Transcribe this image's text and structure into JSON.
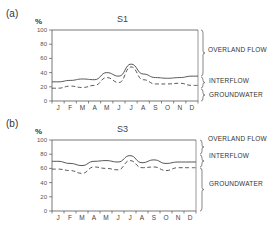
{
  "chart_data": [
    {
      "type": "line",
      "panel_label": "(a)",
      "title": "S1",
      "ylabel": "%",
      "xlabel": "",
      "ylim": [
        0,
        100
      ],
      "yticks": [
        "0",
        "20",
        "40",
        "60",
        "80",
        "100"
      ],
      "categories": [
        "J",
        "F",
        "M",
        "A",
        "M",
        "J",
        "J",
        "A",
        "S",
        "O",
        "N",
        "D"
      ],
      "series": [
        {
          "name": "Overland flow / Interflow boundary",
          "style": "solid",
          "values": [
            27,
            29,
            31,
            30,
            40,
            35,
            52,
            38,
            33,
            32,
            33,
            35
          ]
        },
        {
          "name": "Interflow / Groundwater boundary",
          "style": "dashed",
          "values": [
            18,
            21,
            19,
            22,
            33,
            26,
            48,
            30,
            24,
            24,
            25,
            22
          ]
        }
      ],
      "zones": [
        "OVERLAND FLOW",
        "INTERFLOW",
        "GROUNDWATER"
      ],
      "grid": false
    },
    {
      "type": "line",
      "panel_label": "(b)",
      "title": "S3",
      "ylabel": "%",
      "xlabel": "",
      "ylim": [
        0,
        100
      ],
      "yticks": [
        "0",
        "20",
        "40",
        "60",
        "80",
        "100"
      ],
      "categories": [
        "J",
        "F",
        "M",
        "A",
        "M",
        "J",
        "J",
        "A",
        "S",
        "O",
        "N",
        "D"
      ],
      "series": [
        {
          "name": "Overland flow / Interflow boundary",
          "style": "solid",
          "values": [
            70,
            67,
            64,
            70,
            71,
            69,
            78,
            68,
            72,
            67,
            69,
            69
          ]
        },
        {
          "name": "Interflow / Groundwater boundary",
          "style": "dashed",
          "values": [
            59,
            57,
            53,
            62,
            60,
            58,
            71,
            61,
            62,
            57,
            61,
            61
          ]
        }
      ],
      "zones": [
        "OVERLAND FLOW",
        "INTERFLOW",
        "GROUNDWATER"
      ],
      "grid": false
    }
  ],
  "panels": [
    {
      "label": "(a)",
      "title": "S1",
      "unit": "%",
      "zones": {
        "top": "OVERLAND FLOW",
        "mid": "INTERFLOW",
        "bottom": "GROUNDWATER"
      }
    },
    {
      "label": "(b)",
      "title": "S3",
      "unit": "%",
      "zones": {
        "top": "OVERLAND FLOW",
        "mid": "INTERFLOW",
        "bottom": "GROUNDWATER"
      }
    }
  ],
  "colors": {
    "line": "#444444",
    "axis": "#555555",
    "text": "#333333"
  }
}
